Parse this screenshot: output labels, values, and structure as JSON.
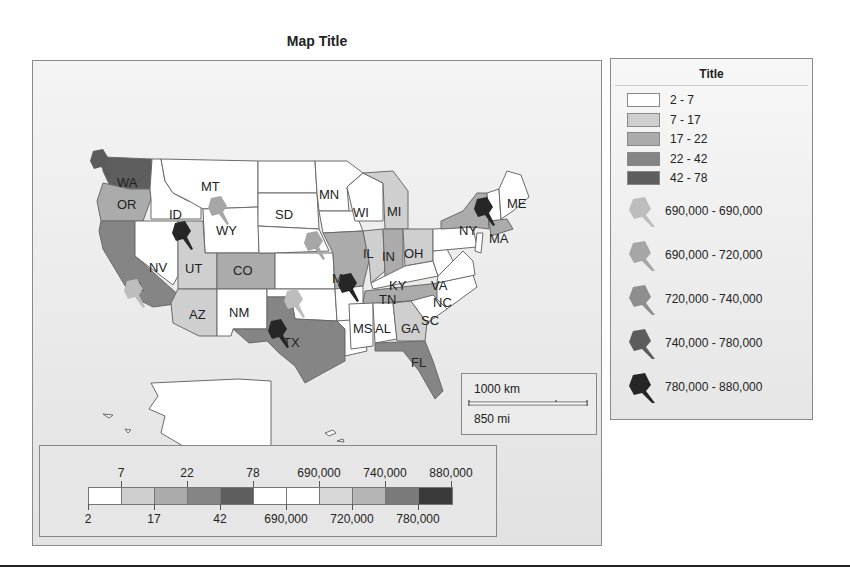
{
  "map": {
    "title": "Map Title",
    "states": [
      {
        "code": "WA",
        "class": "42 - 78"
      },
      {
        "code": "OR",
        "class": "17 - 22"
      },
      {
        "code": "CA",
        "class": "22 - 42"
      },
      {
        "code": "ID",
        "class": "2 - 7"
      },
      {
        "code": "NV",
        "class": "2 - 7"
      },
      {
        "code": "MT",
        "class": "2 - 7"
      },
      {
        "code": "WY",
        "class": "2 - 7"
      },
      {
        "code": "UT",
        "class": "7 - 17"
      },
      {
        "code": "CO",
        "class": "17 - 22"
      },
      {
        "code": "AZ",
        "class": "7 - 17"
      },
      {
        "code": "NM",
        "class": "2 - 7"
      },
      {
        "code": "SD",
        "class": "2 - 7"
      },
      {
        "code": "TX",
        "class": "22 - 42"
      },
      {
        "code": "MN",
        "class": "2 - 7"
      },
      {
        "code": "WI",
        "class": "2 - 7"
      },
      {
        "code": "MI",
        "class": "7 - 17"
      },
      {
        "code": "IL",
        "class": "7 - 17"
      },
      {
        "code": "IN",
        "class": "17 - 22"
      },
      {
        "code": "OH",
        "class": "7 - 17"
      },
      {
        "code": "MO",
        "class": "17 - 22"
      },
      {
        "code": "KY",
        "class": "2 - 7"
      },
      {
        "code": "TN",
        "class": "17 - 22"
      },
      {
        "code": "VA",
        "class": "2 - 7"
      },
      {
        "code": "NC",
        "class": "2 - 7"
      },
      {
        "code": "SC",
        "class": "2 - 7"
      },
      {
        "code": "GA",
        "class": "7 - 17"
      },
      {
        "code": "FL",
        "class": "22 - 42"
      },
      {
        "code": "MS",
        "class": "2 - 7"
      },
      {
        "code": "AL",
        "class": "2 - 7"
      },
      {
        "code": "NY",
        "class": "17 - 22"
      },
      {
        "code": "MA",
        "class": "17 - 22"
      },
      {
        "code": "ME",
        "class": "2 - 7"
      }
    ],
    "labels": {
      "WA": "WA",
      "OR": "OR",
      "CA": "CA",
      "ID": "ID",
      "NV": "NV",
      "MT": "MT",
      "WY": "WY",
      "UT": "UT",
      "CO": "CO",
      "AZ": "AZ",
      "NM": "NM",
      "SD": "SD",
      "TX": "TX",
      "MN": "MN",
      "WI": "WI",
      "MI": "MI",
      "IL": "IL",
      "IN": "IN",
      "OH": "OH",
      "MO": "MO",
      "KY": "KY",
      "TN": "TN",
      "VA": "VA",
      "NC": "NC",
      "SC": "SC",
      "GA": "GA",
      "FL": "FL",
      "MS": "MS",
      "AL": "AL",
      "NY": "NY",
      "MA": "MA",
      "ME": "ME"
    },
    "scale": {
      "km": "1000 km",
      "mi": "850 mi"
    }
  },
  "legend": {
    "title": "Title",
    "classes": [
      {
        "label": "2 - 7",
        "color": "#ffffff"
      },
      {
        "label": "7 - 17",
        "color": "#cfcfcf"
      },
      {
        "label": "17 - 22",
        "color": "#ababab"
      },
      {
        "label": "22 - 42",
        "color": "#858585"
      },
      {
        "label": "42 - 78",
        "color": "#5e5e5e"
      }
    ],
    "pins": [
      {
        "label": "690,000 - 690,000",
        "color": "#bdbdbd"
      },
      {
        "label": "690,000 - 720,000",
        "color": "#a6a6a6"
      },
      {
        "label": "720,000 - 740,000",
        "color": "#8e8e8e"
      },
      {
        "label": "740,000 - 780,000",
        "color": "#5c5c5c"
      },
      {
        "label": "780,000 - 880,000",
        "color": "#262626"
      }
    ]
  },
  "ramp": {
    "top_ticks": [
      "7",
      "22",
      "78",
      "690,000",
      "740,000",
      "880,000"
    ],
    "bottom_ticks": [
      "2",
      "17",
      "42",
      "690,000",
      "720,000",
      "780,000"
    ],
    "colors": [
      "#ffffff",
      "#cfcfcf",
      "#ababab",
      "#858585",
      "#5e5e5e",
      "#ffffff",
      "#ffffff",
      "#d8d8d8",
      "#b5b5b5",
      "#7a7a7a",
      "#3a3a3a"
    ]
  }
}
